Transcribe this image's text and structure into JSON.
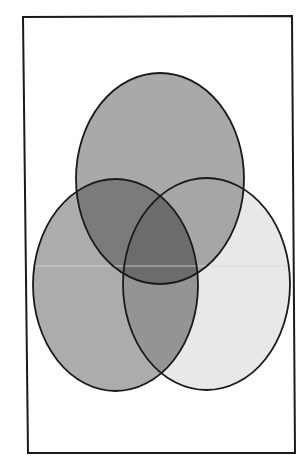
{
  "diagram": {
    "type": "venn",
    "sets": 3,
    "frame": {
      "points": [
        [
          23,
          17
        ],
        [
          292,
          16
        ],
        [
          295,
          453
        ],
        [
          28,
          453
        ]
      ],
      "stroke": "#1a1a1a",
      "stroke_width": 2
    },
    "ellipses": {
      "top": {
        "cx": 160,
        "cy": 178.5,
        "rx": 84,
        "ry": 105.5
      },
      "left": {
        "cx": 115.5,
        "cy": 285,
        "rx": 82.5,
        "ry": 106
      },
      "right": {
        "cx": 206.5,
        "cy": 284,
        "rx": 83.5,
        "ry": 106
      }
    },
    "colors": {
      "top_only": "#a9a9a9",
      "left_only": "#acacac",
      "right_only": "#e8e8e8",
      "top_left": "#7b7b7b",
      "top_right": "#a6a6a6",
      "left_right": "#949494",
      "all_three": "#6c6c6c",
      "outline": "#1a1a1a",
      "background": "#ffffff",
      "scan_line": "#d8d8d8"
    },
    "scan_line_y": 266
  }
}
